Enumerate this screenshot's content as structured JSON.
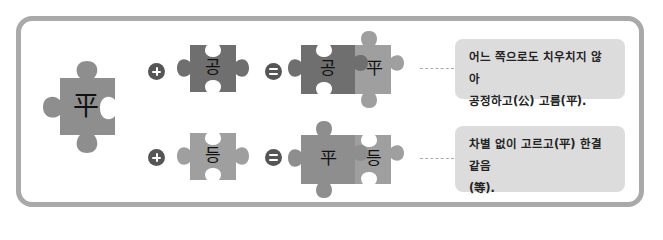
{
  "colors": {
    "frame_border": "#a9a9a9",
    "piece_main": "#8e8e8e",
    "piece_dark": "#6f6f6f",
    "piece_light": "#9f9f9f",
    "operator": "#555555",
    "note_bg": "#dcdcdc"
  },
  "main_piece": {
    "char": "平"
  },
  "rows": [
    {
      "operator_plus": "plus-icon",
      "left_piece": {
        "char": "공"
      },
      "operator_equals": "equals-icon",
      "result": [
        {
          "char": "공"
        },
        {
          "char": "平"
        }
      ],
      "note": {
        "line1": "어느 쪽으로도 치우치지 않아",
        "line2": "공정하고(公) 고름(平)."
      }
    },
    {
      "operator_plus": "plus-icon",
      "left_piece": {
        "char": "등"
      },
      "operator_equals": "equals-icon",
      "result": [
        {
          "char": "平"
        },
        {
          "char": "등"
        }
      ],
      "note": {
        "line1": "차별 없이 고르고(平) 한결같음",
        "line2": "(等)."
      }
    }
  ]
}
